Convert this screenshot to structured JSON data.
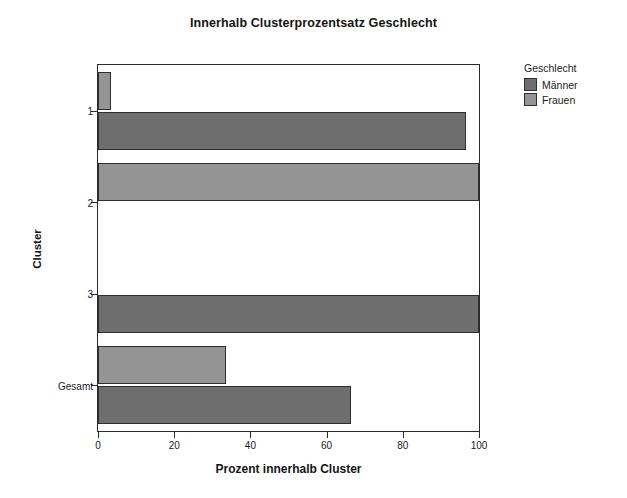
{
  "chart_data": {
    "type": "bar",
    "orientation": "horizontal",
    "grouped": true,
    "title": "Innerhalb Clusterprozentsatz Geschlecht",
    "xlabel": "Prozent innerhalb Cluster",
    "ylabel": "Cluster",
    "categories": [
      "1",
      "2",
      "3",
      "Gesamt"
    ],
    "xticks": [
      "0",
      "20",
      "40",
      "60",
      "80",
      "100"
    ],
    "xlim": [
      0,
      100
    ],
    "grid": false,
    "legend": {
      "title": "Geschlecht",
      "position": "right",
      "entries": [
        {
          "label": "Männer",
          "color": "#6e6e6e"
        },
        {
          "label": "Frauen",
          "color": "#949494"
        }
      ]
    },
    "series": [
      {
        "name": "Männer",
        "color": "#6e6e6e",
        "values": [
          96.5,
          0,
          100,
          66.5
        ]
      },
      {
        "name": "Frauen",
        "color": "#949494",
        "values": [
          3.5,
          100,
          0,
          33.5
        ]
      }
    ]
  }
}
